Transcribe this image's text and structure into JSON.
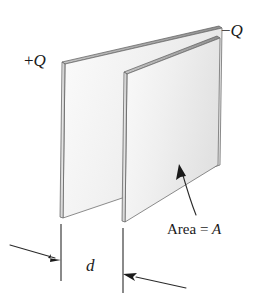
{
  "figure": {
    "type": "technical-line-diagram",
    "width": 275,
    "height": 296,
    "background_color": "#ffffff",
    "line_color": "#3a3a3a",
    "plate_fill_color": "#f1f1f1",
    "plate_edge_fill_color": "#d8d8d8",
    "labels": {
      "positive_charge_sign": "+",
      "positive_charge_symbol": "Q",
      "negative_charge_sign": "−",
      "negative_charge_symbol": "Q",
      "area_text": "Area = ",
      "area_symbol": "A",
      "separation_symbol": "d"
    },
    "annotations": {
      "area_callout": "curved arrow pointing to front plate face",
      "separation_dimension": "double arrow between plate extension lines"
    }
  }
}
